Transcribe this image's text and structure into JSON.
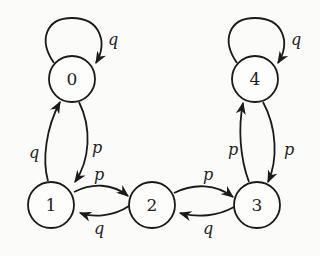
{
  "diagram": {
    "type": "state-transition-diagram",
    "stroke_color": "#1a1a1a",
    "background": "#fbfbf9",
    "nodes": [
      {
        "id": "0",
        "label": "0",
        "cx": 72,
        "cy": 79
      },
      {
        "id": "1",
        "label": "1",
        "cx": 51,
        "cy": 205
      },
      {
        "id": "2",
        "label": "2",
        "cx": 152,
        "cy": 205
      },
      {
        "id": "3",
        "label": "3",
        "cx": 257,
        "cy": 205
      },
      {
        "id": "4",
        "label": "4",
        "cx": 255,
        "cy": 79
      }
    ],
    "edges": [
      {
        "from": "0",
        "to": "0",
        "label": "q"
      },
      {
        "from": "4",
        "to": "4",
        "label": "q"
      },
      {
        "from": "1",
        "to": "0",
        "label": "q"
      },
      {
        "from": "0",
        "to": "1",
        "label": "p"
      },
      {
        "from": "1",
        "to": "2",
        "label": "p"
      },
      {
        "from": "2",
        "to": "1",
        "label": "q"
      },
      {
        "from": "2",
        "to": "3",
        "label": "p"
      },
      {
        "from": "3",
        "to": "2",
        "label": "q"
      },
      {
        "from": "3",
        "to": "4",
        "label": "p"
      },
      {
        "from": "4",
        "to": "3",
        "label": "p"
      }
    ]
  }
}
